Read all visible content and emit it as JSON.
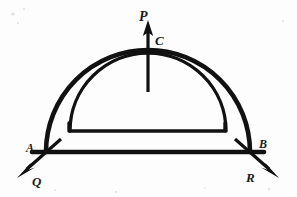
{
  "figure": {
    "background_color": "#fdfdfd",
    "ink_color": "#111111",
    "labels": {
      "apex_force": "P",
      "apex_point": "C",
      "left_support": "A",
      "right_support": "B",
      "left_reaction": "Q",
      "right_reaction": "R"
    }
  },
  "diagram_data": {
    "type": "free-body-diagram",
    "structure": "semicircular arch (extrados and intrados curves) springing from two supports joined by a horizontal tie line",
    "members": [
      {
        "name": "outer-arch",
        "description": "outer (extrados) semicircular curve",
        "center": [
          148,
          152
        ],
        "radius": 102,
        "span_start": [
          46,
          152
        ],
        "span_end": [
          250,
          152
        ],
        "apex": [
          148,
          50
        ]
      },
      {
        "name": "inner-arch",
        "description": "inner (intrados) semicircular curve",
        "center": [
          148,
          131
        ],
        "radius": 78,
        "span_start": [
          70,
          131
        ],
        "span_end": [
          226,
          131
        ],
        "apex": [
          148,
          53
        ]
      },
      {
        "name": "inner-base-line",
        "description": "horizontal soffit line closing the inner arch",
        "from": [
          68,
          131
        ],
        "to": [
          226,
          131
        ]
      },
      {
        "name": "tie-line",
        "description": "horizontal base line joining support A to support B",
        "from": [
          30,
          152
        ],
        "to": [
          266,
          152
        ]
      }
    ],
    "forces": [
      {
        "name": "P",
        "point_label": "C",
        "applied_at": [
          148,
          90
        ],
        "direction": "up",
        "angle_deg": 90,
        "tail": [
          148,
          92
        ],
        "tip": [
          148,
          22
        ]
      },
      {
        "name": "Q",
        "point_label": "A",
        "applied_at": [
          46,
          152
        ],
        "direction": "down-left",
        "angle_deg": 215,
        "tail": [
          60,
          140
        ],
        "tip": [
          18,
          177
        ]
      },
      {
        "name": "R",
        "point_label": "B",
        "applied_at": [
          250,
          152
        ],
        "direction": "down-right",
        "angle_deg": -35,
        "tail": [
          236,
          140
        ],
        "tip": [
          279,
          177
        ]
      }
    ],
    "label_positions": {
      "P": [
        144,
        18
      ],
      "C": [
        159,
        41
      ],
      "A": [
        30,
        150
      ],
      "B": [
        261,
        146
      ],
      "Q": [
        35,
        182
      ],
      "R": [
        250,
        179
      ]
    }
  }
}
